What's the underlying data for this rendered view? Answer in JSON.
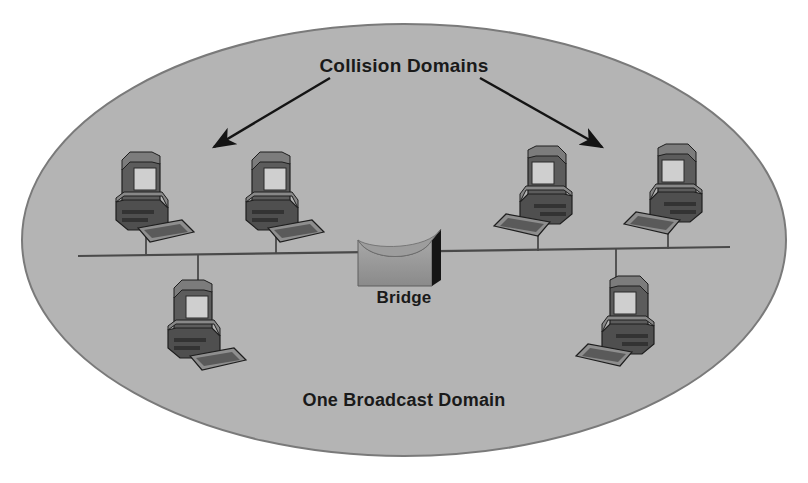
{
  "diagram": {
    "type": "network-topology",
    "title": "Collision Domains",
    "bridge_label": "Bridge",
    "footer_label": "One Broadcast Domain",
    "colors": {
      "page_background": "#ffffff",
      "domain_fill": "#b4b4b4",
      "domain_stroke": "#7a7a7a",
      "bus_line": "#4a4a4a",
      "text": "#1a1a1a",
      "bridge_body": "#8a8a8a",
      "bridge_side": "#151515",
      "computer_dark": "#4b4b4b",
      "computer_mid": "#6e6e6e",
      "computer_light": "#9a9a9a",
      "computer_screen": "#cfcfcf",
      "computer_outline": "#1e1e1e"
    },
    "broadcast_domain": {
      "shape": "ellipse",
      "center_x": 404,
      "center_y": 240,
      "radius_x": 382,
      "radius_y": 216
    },
    "bus": {
      "label": "network-bus-segment",
      "x1": 78,
      "y1": 256,
      "x2": 730,
      "y2": 247
    },
    "bridge": {
      "x": 358,
      "y": 229,
      "width": 82,
      "height": 57
    },
    "arrows": [
      {
        "name": "arrow-left-collision-domain",
        "x1": 330,
        "y1": 78,
        "x2": 212,
        "y2": 148
      },
      {
        "name": "arrow-right-collision-domain",
        "x1": 480,
        "y1": 78,
        "x2": 604,
        "y2": 148
      }
    ],
    "computers": [
      {
        "name": "computer-top-left-1",
        "x": 108,
        "y": 152,
        "mirrored": false,
        "stem_to": 256,
        "position": "above-bus"
      },
      {
        "name": "computer-top-left-2",
        "x": 238,
        "y": 152,
        "mirrored": false,
        "stem_to": 254,
        "position": "above-bus"
      },
      {
        "name": "computer-top-right-1",
        "x": 496,
        "y": 146,
        "mirrored": true,
        "stem_to": 250,
        "position": "above-bus"
      },
      {
        "name": "computer-top-right-2",
        "x": 626,
        "y": 144,
        "mirrored": true,
        "stem_to": 248,
        "position": "above-bus"
      },
      {
        "name": "computer-bottom-left",
        "x": 160,
        "y": 280,
        "mirrored": false,
        "stem_to": 256,
        "position": "below-bus"
      },
      {
        "name": "computer-bottom-right",
        "x": 578,
        "y": 276,
        "mirrored": true,
        "stem_to": 248,
        "position": "below-bus"
      }
    ],
    "collision_domain_count": 2,
    "computer_count": 6
  }
}
